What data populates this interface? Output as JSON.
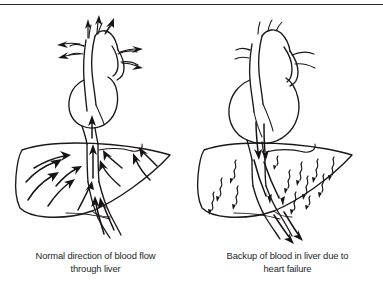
{
  "figure": {
    "background_color": "#ffffff",
    "ink_color": "#1b1717",
    "text_color": "#231f1f",
    "rule_color": "#2b2b2b",
    "panel_count": 2
  },
  "panels": [
    {
      "id": "normal-flow",
      "caption_line1": "Normal direction of blood flow",
      "caption_line2": "through liver",
      "heart_state": "normal-size",
      "flow_direction": "upward-from-liver-into-heart",
      "arrow_style": "smooth-curved",
      "arrow_count": 14,
      "organs": [
        {
          "name": "heart",
          "label": "heart"
        },
        {
          "name": "aorta",
          "label": "aorta"
        },
        {
          "name": "inferior-vena-cava",
          "label": "inferior vena cava"
        },
        {
          "name": "liver",
          "label": "liver"
        },
        {
          "name": "portal-vein",
          "label": "portal vein"
        }
      ]
    },
    {
      "id": "backup-flow",
      "caption_line1": "Backup of blood in liver due to",
      "caption_line2": "heart failure",
      "heart_state": "enlarged-failing",
      "flow_direction": "downward-backup-into-liver",
      "arrow_style": "wavy-squiggle",
      "arrow_count": 16,
      "organs": [
        {
          "name": "heart",
          "label": "enlarged heart"
        },
        {
          "name": "aorta",
          "label": "aorta"
        },
        {
          "name": "inferior-vena-cava",
          "label": "inferior vena cava"
        },
        {
          "name": "liver",
          "label": "congested liver"
        },
        {
          "name": "portal-vein",
          "label": "portal vein"
        }
      ]
    }
  ]
}
